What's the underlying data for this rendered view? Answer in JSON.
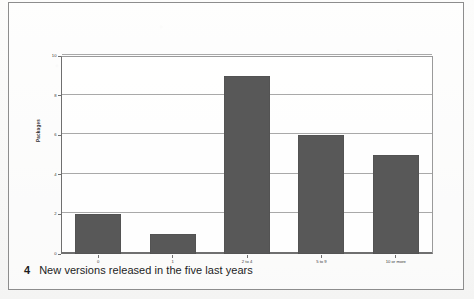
{
  "caption": {
    "number": "4",
    "text": "New versions released in the five last years"
  },
  "chart_data": {
    "type": "bar",
    "title": "",
    "subtitle": "",
    "xlabel": "",
    "ylabel": "Packages",
    "categories": [
      "0",
      "1",
      "2 to 4",
      "5 to 9",
      "10 or more"
    ],
    "values": [
      2,
      1,
      9,
      6,
      5
    ],
    "ylim": [
      0,
      10
    ],
    "yticks": [
      0,
      2,
      4,
      6,
      8,
      10
    ],
    "ytick_labels": [
      "0",
      "2",
      "4",
      "6",
      "8",
      "10"
    ],
    "grid": true,
    "legend": false,
    "legend_position": "none",
    "bar_color": "#585858",
    "series": [
      {
        "name": "Packages",
        "values": [
          2,
          1,
          9,
          6,
          5
        ]
      }
    ]
  },
  "style": {
    "bar_color": "#585858",
    "grid_color": "#a9a9a9",
    "axis_color": "#6f6f6f",
    "frame_color": "#8d8d8d",
    "text_color": "#1d1d1d",
    "page_background": "#fbfbfa"
  }
}
